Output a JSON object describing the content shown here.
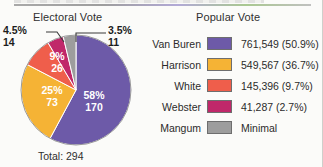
{
  "chart_data": {
    "type": "pie",
    "title": "Electoral Vote",
    "categories": [
      "Van Buren",
      "Harrison",
      "White",
      "Webster",
      "Mangum"
    ],
    "values": [
      170,
      73,
      26,
      14,
      11
    ],
    "percent_labels": [
      "58%",
      "25%",
      "9%",
      "4.5%",
      "3.5%"
    ],
    "count_labels": [
      "170",
      "73",
      "26",
      "14",
      "11"
    ],
    "colors": [
      "#6d5aa8",
      "#f5b335",
      "#ef5e4b",
      "#c0286a",
      "#9d9d9d"
    ],
    "total": 294,
    "total_label": "Total: 294",
    "legend_position": "right",
    "grid": false,
    "xlabel": "",
    "ylabel": ""
  },
  "electoral": {
    "title": "Electoral Vote",
    "total_label": "Total: 294",
    "slices": [
      {
        "name": "Van Buren",
        "percent": "58%",
        "count": "170",
        "color": "#6d5aa8",
        "label_inside": true
      },
      {
        "name": "Harrison",
        "percent": "25%",
        "count": "73",
        "color": "#f5b335",
        "label_inside": true
      },
      {
        "name": "White",
        "percent": "9%",
        "count": "26",
        "color": "#ef5e4b",
        "label_inside": true
      },
      {
        "name": "Webster",
        "percent": "4.5%",
        "count": "14",
        "color": "#c0286a",
        "label_inside": false
      },
      {
        "name": "Mangum",
        "percent": "3.5%",
        "count": "11",
        "color": "#9d9d9d",
        "label_inside": false
      }
    ],
    "callouts": {
      "webster": {
        "percent": "4.5%",
        "count": "14"
      },
      "mangum": {
        "percent": "3.5%",
        "count": "11"
      }
    },
    "inside_labels": {
      "van_buren_percent": "58%",
      "van_buren_count": "170",
      "harrison_percent": "25%",
      "harrison_count": "73",
      "white_percent": "9%",
      "white_count": "26"
    }
  },
  "popular": {
    "title": "Popular Vote",
    "rows": [
      {
        "name": "Van Buren",
        "color": "#6d5aa8",
        "value": "761,549 (50.9%)"
      },
      {
        "name": "Harrison",
        "color": "#f5b335",
        "value": "549,567 (36.7%)"
      },
      {
        "name": "White",
        "color": "#ef5e4b",
        "value": "145,396 (9.7%)"
      },
      {
        "name": "Webster",
        "color": "#c0286a",
        "value": "41,287 (2.7%)"
      },
      {
        "name": "Mangum",
        "color": "#9d9d9d",
        "value": "Minimal"
      }
    ]
  }
}
